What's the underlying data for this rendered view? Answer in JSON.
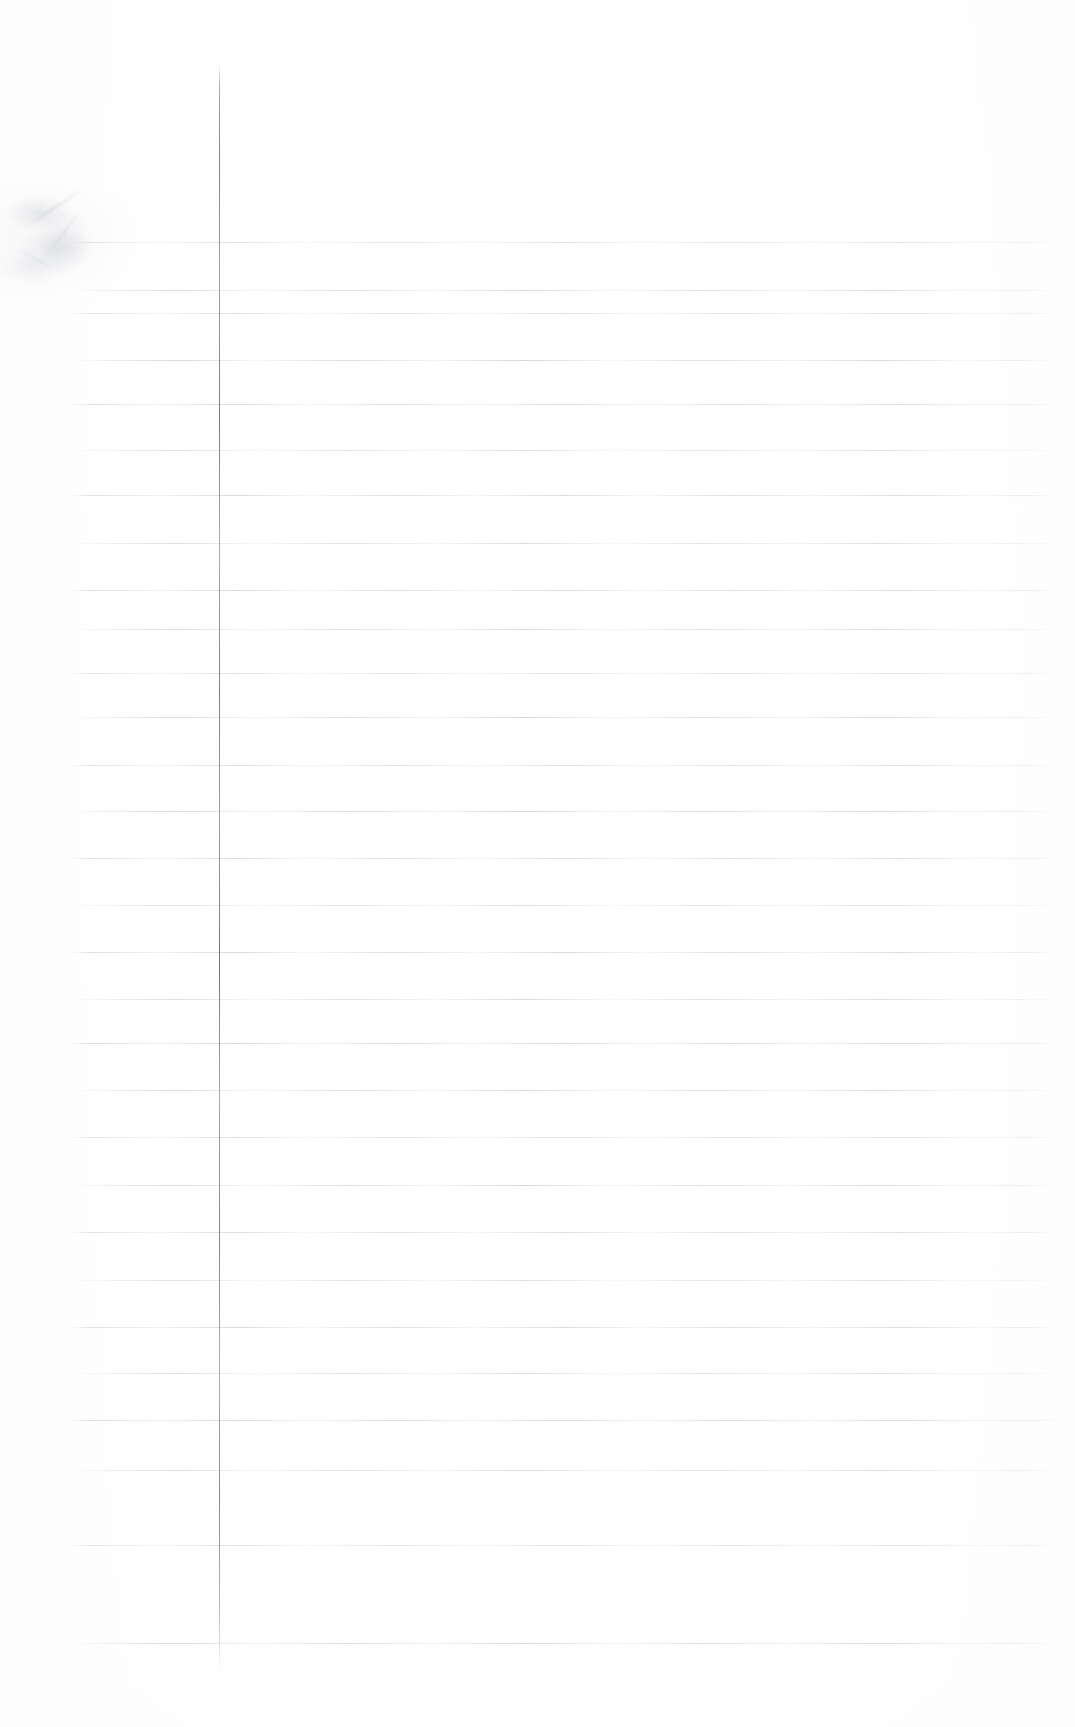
{
  "document": {
    "kind": "scanned-notebook-page",
    "title": "Blank Ruled Notebook Page",
    "caption": "Scan of a blank sheet of wide-ruled notebook paper with a vertical red-grey margin rule and faint pencil smudges near the upper-left edge.",
    "visible_text": "",
    "page_width": 1075,
    "page_height": 1727,
    "background_color": "#ffffff",
    "paper_color": "#fefefe"
  },
  "margin_rule": {
    "name": "vertical-margin-line",
    "color": "#70737b",
    "x": 219,
    "y_start": 64,
    "y_end": 1672,
    "thickness": 1
  },
  "ruled_lines": {
    "name": "horizontal-ruled-lines",
    "color": "#b9bec9",
    "count": 30,
    "x_start": 70,
    "x_end": 1058,
    "first_y": 242,
    "spacing": 48.3,
    "thickness": 1,
    "y_positions": [
      242,
      290,
      313,
      360,
      404,
      450,
      495,
      543,
      590,
      629,
      673,
      717,
      765,
      811,
      858,
      905,
      952,
      999,
      1043,
      1090,
      1137,
      1185,
      1232,
      1280,
      1327,
      1373,
      1420,
      1470,
      1545,
      1643
    ]
  },
  "marks": {
    "name": "pencil-smudges",
    "description": "faint graphite smudges in the upper-left margin area",
    "items": [
      {
        "id": "smudge-a",
        "x": 8,
        "y": 196,
        "w": 60,
        "h": 34
      },
      {
        "id": "smudge-b",
        "x": 20,
        "y": 228,
        "w": 74,
        "h": 40
      },
      {
        "id": "smudge-c",
        "x": 0,
        "y": 248,
        "w": 66,
        "h": 36
      },
      {
        "id": "smudge-d",
        "x": 38,
        "y": 205,
        "w": 52,
        "h": 70
      },
      {
        "id": "streak-a",
        "x": 22,
        "y": 206,
        "w": 66,
        "h": 3
      },
      {
        "id": "streak-b",
        "x": 34,
        "y": 232,
        "w": 58,
        "h": 3
      },
      {
        "id": "streak-c",
        "x": 6,
        "y": 258,
        "w": 62,
        "h": 3
      }
    ]
  }
}
